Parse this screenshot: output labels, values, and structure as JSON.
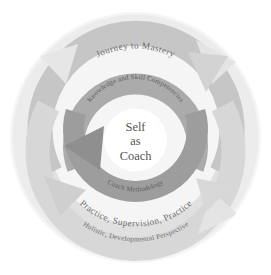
{
  "diagram": {
    "title": "Self as Coach",
    "type": "concentric-circular-model",
    "center": {
      "lines": [
        "Self",
        "as",
        "Coach"
      ]
    },
    "rings": [
      {
        "id": "ring-outer-band",
        "label": "Holistic, Developmental Perspective",
        "position": "outermost",
        "color": "#efefef",
        "text_color": "#6e6e6e"
      },
      {
        "id": "ring-practice",
        "label": "Practice, Supervision, Practice",
        "position": "second-outermost",
        "color": "#d9d9d9",
        "text_color": "#6e6e6e"
      },
      {
        "id": "ring-journey",
        "label": "Journey to Mastery",
        "position": "middle",
        "color": "#c3c3c3",
        "text_color": "#6e6e6e"
      },
      {
        "id": "ring-knowledge",
        "label": "Knowledge and Skill Competencies",
        "position": "inner",
        "color": "#a8a8a8",
        "text_color": "#5d5d5d"
      },
      {
        "id": "ring-methodology",
        "label": "Coach Methodology",
        "position": "inner-lower",
        "color": "#9a9a9a",
        "text_color": "#5d5d5d"
      }
    ],
    "arrows": [
      {
        "id": "arrow-outer-upper-right",
        "direction": "up-right"
      },
      {
        "id": "arrow-outer-lower-right",
        "direction": "down-right"
      },
      {
        "id": "arrow-mid-upper-right",
        "direction": "up-right"
      },
      {
        "id": "arrow-mid-lower-left",
        "direction": "down-left"
      },
      {
        "id": "arrow-inner-left",
        "direction": "left"
      }
    ],
    "colors": {
      "background": "#ffffff",
      "disc_background": "#f4f4f4",
      "band_outer": "#efefef",
      "band_practice": "#d9d9d9",
      "band_journey": "#c3c3c3",
      "band_knowledge": "#a8a8a8",
      "band_methodology": "#9a9a9a",
      "center_fill": "#ffffff",
      "text_primary": "#555555",
      "text_secondary": "#6e6e6e"
    }
  }
}
